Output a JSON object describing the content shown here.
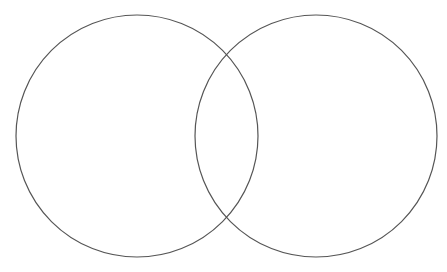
{
  "diagram": {
    "type": "venn",
    "set_count": 2,
    "background": "#ffffff",
    "stroke_color": "#555555",
    "stroke_width": 1.2,
    "circles": [
      {
        "id": "set-a",
        "cx": 137,
        "cy": 136,
        "r": 121,
        "label": ""
      },
      {
        "id": "set-b",
        "cx": 316,
        "cy": 136,
        "r": 121,
        "label": ""
      }
    ]
  }
}
